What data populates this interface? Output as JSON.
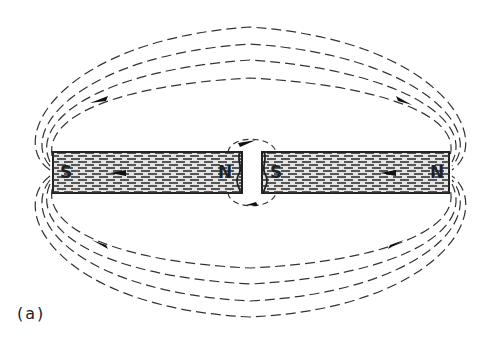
{
  "figure": {
    "caption": "(a)"
  },
  "magnets": [
    {
      "id": "left",
      "left_pole": "S",
      "right_pole": "N",
      "x": 53,
      "y": 152,
      "width": 189,
      "height": 41
    },
    {
      "id": "right",
      "left_pole": "S",
      "right_pole": "N",
      "x": 262,
      "y": 152,
      "width": 187,
      "height": 41
    }
  ],
  "colors": {
    "line": "#222222",
    "magnet_fill": "#d8d8d8",
    "background": "#ffffff"
  }
}
